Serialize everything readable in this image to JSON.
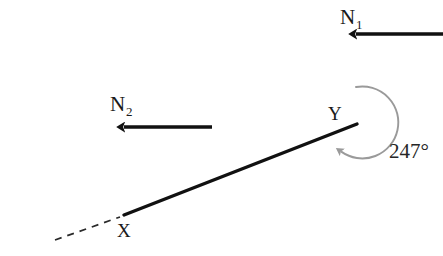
{
  "diagram": {
    "type": "bearing-diagram",
    "title": "",
    "colors": {
      "line": "#111111",
      "arc": "#9a9a9a",
      "text": "#1a1a1a",
      "dashed": "#2a2a2a",
      "background": "#ffffff"
    },
    "points": [
      {
        "id": "X",
        "label": "X",
        "x": 124,
        "y": 215
      },
      {
        "id": "Y",
        "label": "Y",
        "x": 356,
        "y": 124
      }
    ],
    "north_lines": [
      {
        "id": "N1",
        "label": "N",
        "subscript": "1",
        "at_point": "Y",
        "x": 356,
        "top_y": 29
      },
      {
        "id": "N2",
        "label": "N",
        "subscript": "2",
        "at_point": "X",
        "x": 124,
        "top_y": 122
      }
    ],
    "segments": [
      {
        "id": "XY",
        "from": "X",
        "to": "Y",
        "style": "solid"
      },
      {
        "id": "dashed-extension",
        "from": [
          55,
          240
        ],
        "to": [
          120,
          217
        ],
        "style": "dashed"
      }
    ],
    "angle_arc": {
      "label": "247°",
      "value": 247,
      "unit": "degrees",
      "center": [
        356,
        123
      ],
      "radius": 36,
      "direction": "clockwise",
      "from_bearing": 0,
      "to_bearing": 247
    },
    "angle_label_position": {
      "x": 389,
      "y": 156
    }
  }
}
